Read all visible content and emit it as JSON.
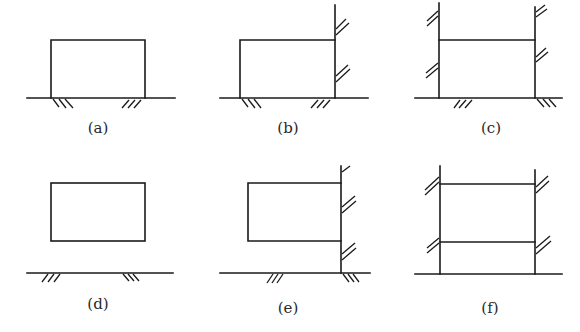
{
  "figure": {
    "panels": [
      {
        "id": "a",
        "label": "(a)",
        "description": "Rectangle resting on ground with hatched supports at base"
      },
      {
        "id": "b",
        "label": "(b)",
        "description": "Rectangle on ground with right side extended as wall having hatches"
      },
      {
        "id": "c",
        "label": "(c)",
        "description": "Two vertical walls with hatches connected by horizontal member, on ground"
      },
      {
        "id": "d",
        "label": "(d)",
        "description": "Rectangle detached above hatched ground line"
      },
      {
        "id": "e",
        "label": "(e)",
        "description": "Rectangle attached to right hatched wall, above ground"
      },
      {
        "id": "f",
        "label": "(f)",
        "description": "Two hatched walls connected by two horizontal members, on ground"
      }
    ]
  },
  "colors": {
    "line": "#1a1a1a",
    "background": "#ffffff",
    "label": "#2a2a2a"
  }
}
